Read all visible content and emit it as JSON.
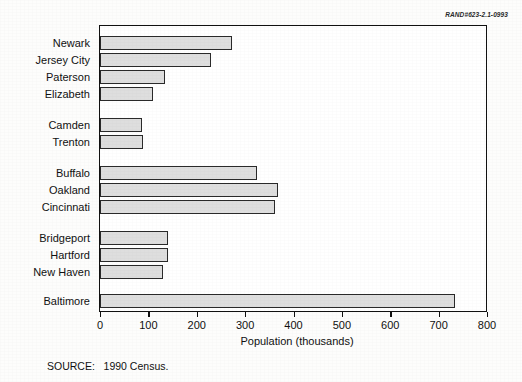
{
  "figure": {
    "rand_id": "RAND#623-2.1-0993",
    "source_note": "SOURCE:   1990 Census."
  },
  "chart_data": {
    "type": "bar",
    "orientation": "horizontal",
    "title": "",
    "xlabel": "Population (thousands)",
    "ylabel": "",
    "xlim": [
      0,
      800
    ],
    "xticks": [
      0,
      100,
      200,
      300,
      400,
      500,
      600,
      700,
      800
    ],
    "xticklabels": [
      "0",
      "100",
      "200",
      "300",
      "400",
      "500",
      "600",
      "700",
      "800"
    ],
    "grid": false,
    "legend": null,
    "bar_color": "#dedede",
    "bar_edge_color": "#2a2a2a",
    "categories": [
      "Newark",
      "Jersey City",
      "Paterson",
      "Elizabeth",
      "Camden",
      "Trenton",
      "Buffalo",
      "Oakland",
      "Cincinnati",
      "Bridgeport",
      "Hartford",
      "New Haven",
      "Baltimore"
    ],
    "values": [
      273,
      229,
      135,
      110,
      87,
      88,
      325,
      368,
      362,
      141,
      140,
      130,
      734
    ],
    "groups": [
      {
        "label": "",
        "categories": [
          "Newark",
          "Jersey City",
          "Paterson",
          "Elizabeth"
        ]
      },
      {
        "label": "",
        "categories": [
          "Camden",
          "Trenton"
        ]
      },
      {
        "label": "",
        "categories": [
          "Buffalo",
          "Oakland",
          "Cincinnati"
        ]
      },
      {
        "label": "",
        "categories": [
          "Bridgeport",
          "Hartford",
          "New Haven"
        ]
      },
      {
        "label": "",
        "categories": [
          "Baltimore"
        ]
      }
    ]
  },
  "layout": {
    "bar_rows_y": [
      10,
      27,
      44,
      61,
      92,
      109,
      140,
      157,
      174,
      205,
      222,
      239,
      268
    ],
    "bar_height": 14,
    "px_per_unit": 0.48375,
    "tick_px": [
      0,
      48.4,
      96.8,
      145.1,
      193.5,
      241.9,
      290.3,
      338.6,
      387.0
    ]
  }
}
